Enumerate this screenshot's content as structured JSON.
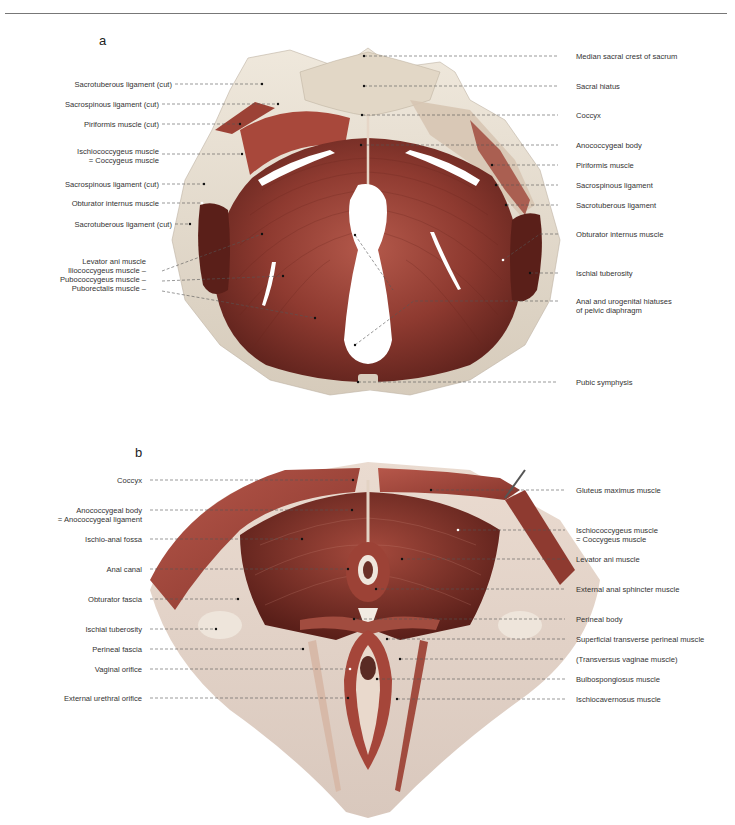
{
  "panel_a": {
    "letter": "a",
    "left_labels": [
      {
        "lines": [
          "Sacrotuberous ligament (cut)"
        ],
        "y": 84,
        "px": 262
      },
      {
        "lines": [
          "Sacrospinous ligament (cut)"
        ],
        "y": 104,
        "px": 278
      },
      {
        "lines": [
          "Piriformis muscle (cut)"
        ],
        "y": 124,
        "px": 240
      },
      {
        "lines": [
          "Ischiococcygeus muscle",
          "= Coccygeus muscle"
        ],
        "y": 154,
        "px": 242
      },
      {
        "lines": [
          "Sacrospinous ligament (cut)"
        ],
        "y": 184,
        "px": 204
      },
      {
        "lines": [
          "Obturator internus muscle"
        ],
        "y": 203,
        "px": 202
      },
      {
        "lines": [
          "Sacrotuberous ligament (cut)"
        ],
        "y": 224,
        "px": 190
      }
    ],
    "levator_group": {
      "title": "Levator ani muscle",
      "items": [
        {
          "label": "Iliococcygeus muscle –",
          "y": 271,
          "px": 262
        },
        {
          "label": "Pubococcygeus muscle –",
          "y": 281,
          "px": 283
        },
        {
          "label": "Puborectalis muscle –",
          "y": 291,
          "px": 315
        }
      ]
    },
    "right_labels": [
      {
        "lines": [
          "Median sacral crest of sacrum"
        ],
        "y": 56,
        "px": 364
      },
      {
        "lines": [
          "Sacral hiatus"
        ],
        "y": 86,
        "px": 364
      },
      {
        "lines": [
          "Coccyx"
        ],
        "y": 115,
        "px": 362
      },
      {
        "lines": [
          "Anococcygeal body"
        ],
        "y": 145,
        "px": 361
      },
      {
        "lines": [
          "Piriformis muscle"
        ],
        "y": 165,
        "px": 492
      },
      {
        "lines": [
          "Sacrospinous ligament"
        ],
        "y": 185,
        "px": 496
      },
      {
        "lines": [
          "Sacrotuberous ligament"
        ],
        "y": 205,
        "px": 506
      },
      {
        "lines": [
          "Obturator internus muscle"
        ],
        "y": 234,
        "px": 503
      },
      {
        "lines": [
          "Ischial tuberosity"
        ],
        "y": 273,
        "px": 530
      },
      {
        "lines": [
          "Anal and urogenital hiatuses",
          "of pelvic diaphragm"
        ],
        "y": 301,
        "px": 415
      },
      {
        "lines": [
          "Pubic symphysis"
        ],
        "y": 382,
        "px": 358
      }
    ]
  },
  "panel_b": {
    "letter": "b",
    "left_labels": [
      {
        "lines": [
          "Coccyx"
        ],
        "y": 480,
        "px": 353
      },
      {
        "lines": [
          "Anococcygeal body",
          "= Anococcygeal ligament"
        ],
        "y": 510,
        "px": 352
      },
      {
        "lines": [
          "Ischio-anal fossa"
        ],
        "y": 539,
        "px": 302
      },
      {
        "lines": [
          "Anal canal"
        ],
        "y": 569,
        "px": 348
      },
      {
        "lines": [
          "Obturator fascia"
        ],
        "y": 599,
        "px": 238
      },
      {
        "lines": [
          "Ischial tuberosity"
        ],
        "y": 629,
        "px": 216
      },
      {
        "lines": [
          "Perineal fascia"
        ],
        "y": 649,
        "px": 303
      },
      {
        "lines": [
          "Vaginal orifice"
        ],
        "y": 669,
        "px": 350
      },
      {
        "lines": [
          "External urethral orifice"
        ],
        "y": 698,
        "px": 348
      }
    ],
    "right_labels": [
      {
        "lines": [
          "Gluteus maximus muscle"
        ],
        "y": 490,
        "px": 431
      },
      {
        "lines": [
          "Ischiococcygeus muscle",
          "= Coccygeus muscle"
        ],
        "y": 530,
        "px": 458
      },
      {
        "lines": [
          "Levator ani muscle"
        ],
        "y": 559,
        "px": 402
      },
      {
        "lines": [
          "External anal sphincter muscle"
        ],
        "y": 589,
        "px": 376
      },
      {
        "lines": [
          "Perineal body"
        ],
        "y": 619,
        "px": 354
      },
      {
        "lines": [
          "Superficial transverse perineal muscle"
        ],
        "y": 639,
        "px": 387
      },
      {
        "lines": [
          "(Transversus vaginae muscle)"
        ],
        "y": 659,
        "px": 400
      },
      {
        "lines": [
          "Bulbospongiosus muscle"
        ],
        "y": 679,
        "px": 377
      },
      {
        "lines": [
          "Ischiocavernosus muscle"
        ],
        "y": 699,
        "px": 397
      }
    ]
  },
  "colors": {
    "muscle_dark": "#7a2f27",
    "muscle_mid": "#a5463a",
    "muscle_light": "#c77a6b",
    "bone": "#e9e0d2",
    "bone_shadow": "#cbbfae",
    "fascia": "#e8d3c6",
    "leader": "#555555"
  }
}
